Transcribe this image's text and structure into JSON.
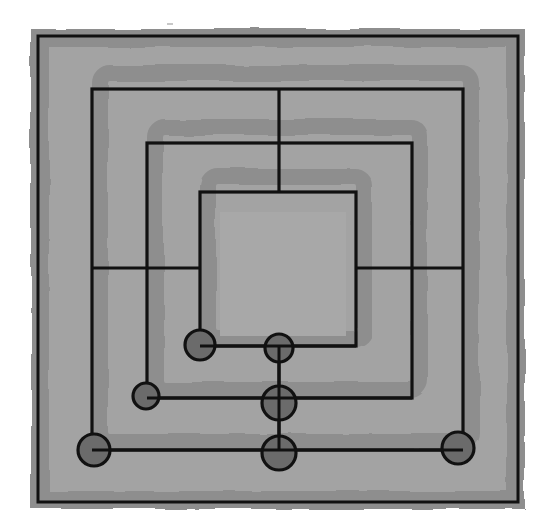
{
  "game": {
    "name": "Nine Men's Morris",
    "board": {
      "frame": {
        "x": 38,
        "y": 36,
        "w": 480,
        "h": 466
      },
      "squares": [
        {
          "id": "outer",
          "x1": 92,
          "y1": 89,
          "x2": 463,
          "y2": 450
        },
        {
          "id": "middle",
          "x1": 147,
          "y1": 143,
          "x2": 412,
          "y2": 398
        },
        {
          "id": "inner",
          "x1": 200,
          "y1": 192,
          "x2": 356,
          "y2": 346
        }
      ],
      "connectors": [
        {
          "id": "top",
          "x1": 279,
          "y1": 89,
          "x2": 279,
          "y2": 192
        },
        {
          "id": "left",
          "x1": 92,
          "y1": 268,
          "x2": 200,
          "y2": 268
        },
        {
          "id": "right",
          "x1": 356,
          "y1": 268,
          "x2": 463,
          "y2": 268
        },
        {
          "id": "bottom",
          "x1": 279,
          "y1": 346,
          "x2": 279,
          "y2": 450
        }
      ]
    },
    "pieces": [
      {
        "id": "inner-bottom-left",
        "x": 200,
        "y": 345,
        "r": 15
      },
      {
        "id": "inner-bottom-center",
        "x": 279,
        "y": 348,
        "r": 14
      },
      {
        "id": "middle-bottom-left",
        "x": 146,
        "y": 396,
        "r": 13
      },
      {
        "id": "middle-bottom-center",
        "x": 279,
        "y": 403,
        "r": 17
      },
      {
        "id": "outer-bottom-left",
        "x": 94,
        "y": 450,
        "r": 16
      },
      {
        "id": "outer-bottom-center",
        "x": 279,
        "y": 453,
        "r": 17
      },
      {
        "id": "outer-bottom-right",
        "x": 458,
        "y": 448,
        "r": 16
      }
    ],
    "colors": {
      "background": "#ffffff",
      "board_light": "#a3a3a3",
      "board_band": "#8e8e8e",
      "line": "#111111",
      "piece_fill": "#6b6b6b"
    }
  }
}
